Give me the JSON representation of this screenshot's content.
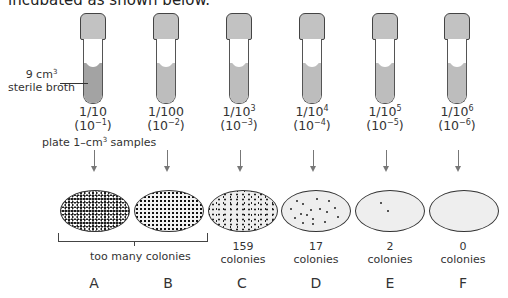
{
  "intro_text": "incubated as shown below.",
  "broth_label": {
    "line1_base": "9 cm",
    "line1_sup": "3",
    "line2": "sterile broth"
  },
  "plate_instruction": {
    "pre": "plate 1–cm",
    "sup": "3",
    "post": " samples"
  },
  "tubes": [
    {
      "fraction_base": "1/10",
      "fraction_sup": "",
      "power_base": "(10",
      "power_sup": "−1",
      "power_close": ")"
    },
    {
      "fraction_base": "1/100",
      "fraction_sup": "",
      "power_base": "(10",
      "power_sup": "−2",
      "power_close": ")"
    },
    {
      "fraction_base": "1/10",
      "fraction_sup": "3",
      "power_base": "(10",
      "power_sup": "−3",
      "power_close": ")"
    },
    {
      "fraction_base": "1/10",
      "fraction_sup": "4",
      "power_base": "(10",
      "power_sup": "−4",
      "power_close": ")"
    },
    {
      "fraction_base": "1/10",
      "fraction_sup": "5",
      "power_base": "(10",
      "power_sup": "−5",
      "power_close": ")"
    },
    {
      "fraction_base": "1/10",
      "fraction_sup": "6",
      "power_base": "(10",
      "power_sup": "−6",
      "power_close": ")"
    }
  ],
  "plates": [
    {
      "letter": "A",
      "count": "",
      "unit": ""
    },
    {
      "letter": "B",
      "count": "",
      "unit": ""
    },
    {
      "letter": "C",
      "count": "159",
      "unit": "colonies"
    },
    {
      "letter": "D",
      "count": "17",
      "unit": "colonies"
    },
    {
      "letter": "E",
      "count": "2",
      "unit": "colonies"
    },
    {
      "letter": "F",
      "count": "0",
      "unit": "colonies"
    }
  ],
  "bracket_label": "too many colonies"
}
